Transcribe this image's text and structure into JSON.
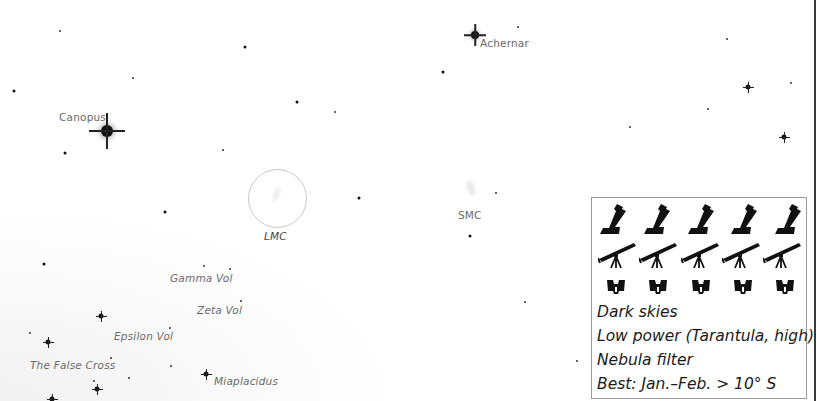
{
  "map": {
    "labels": {
      "canopus": "Canopus",
      "achernar": "Achernar",
      "lmc": "LMC",
      "smc": "SMC",
      "gamma_vol": "Gamma Vol",
      "zeta_vol": "Zeta Vol",
      "epsilon_vol": "Epsilon Vol",
      "false_cross": "The False Cross",
      "miaplacidus": "Miaplacidus"
    }
  },
  "infobox": {
    "icons": {
      "row1": "dobsonian-telescope-icon",
      "row2": "refractor-telescope-icon",
      "row3": "binoculars-icon",
      "count_per_row": 5
    },
    "lines": [
      "Dark skies",
      "Low power (Tarantula, high)",
      "Nebula filter",
      "Best: Jan.–Feb. > 10° S"
    ]
  },
  "colors": {
    "background": "#ffffff",
    "star": "#111111",
    "label": "#6a6a6a",
    "box_border": "#9a9a9a",
    "text": "#1a1a1a"
  }
}
